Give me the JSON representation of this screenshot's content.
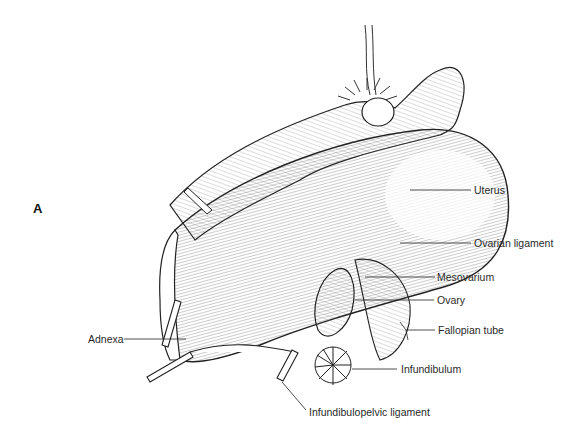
{
  "figure": {
    "panel_letter": "A",
    "labels": {
      "uterus": "Uterus",
      "ovarian_ligament": "Ovarian ligament",
      "mesovarium": "Mesovarium",
      "ovary": "Ovary",
      "fallopian_tube": "Fallopian tube",
      "infundibulum": "Infundibulum",
      "adnexa": "Adnexa",
      "infundibulopelvic_ligament": "Infundibulopelvic ligament"
    }
  }
}
